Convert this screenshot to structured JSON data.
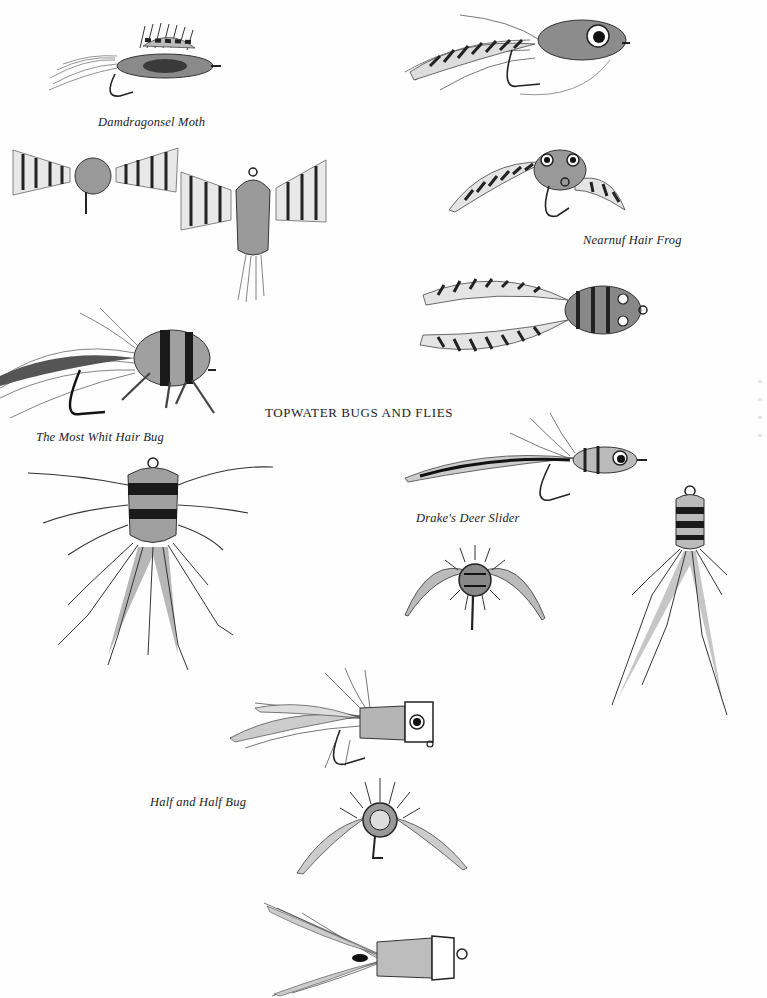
{
  "plate": {
    "title": "TOPWATER BUGS AND FLIES",
    "background": "#fefefe",
    "ink": "#1a1a1a"
  },
  "captions": {
    "damdragonsel_moth": "Damdragonsel Moth",
    "nearnuf_hair_frog": "Nearnuf Hair Frog",
    "most_whit_hair_bug": "The Most Whit Hair Bug",
    "drakes_deer_slider": "Drake's Deer Slider",
    "half_and_half_bug": "Half and Half Bug"
  },
  "illustrations": [
    {
      "id": "damdragonsel-moth",
      "icon": "moth-fly-icon"
    },
    {
      "id": "frog-fly-side",
      "icon": "frog-fly-icon"
    },
    {
      "id": "moth-front-view",
      "icon": "moth-front-icon"
    },
    {
      "id": "moth-top-view",
      "icon": "moth-top-icon"
    },
    {
      "id": "nearnuf-hair-frog",
      "icon": "hair-frog-icon"
    },
    {
      "id": "hair-frog-top-view",
      "icon": "hair-frog-top-icon"
    },
    {
      "id": "most-whit-hair-bug",
      "icon": "hair-bug-icon"
    },
    {
      "id": "hair-bug-top-view",
      "icon": "hair-bug-top-icon"
    },
    {
      "id": "drakes-deer-slider",
      "icon": "deer-slider-icon"
    },
    {
      "id": "deer-slider-front-view",
      "icon": "deer-slider-front-icon"
    },
    {
      "id": "deer-slider-top-view",
      "icon": "deer-slider-top-icon"
    },
    {
      "id": "half-and-half-bug",
      "icon": "popper-icon"
    },
    {
      "id": "half-and-half-front-view",
      "icon": "popper-front-icon"
    },
    {
      "id": "half-and-half-top-view",
      "icon": "popper-top-icon"
    }
  ]
}
